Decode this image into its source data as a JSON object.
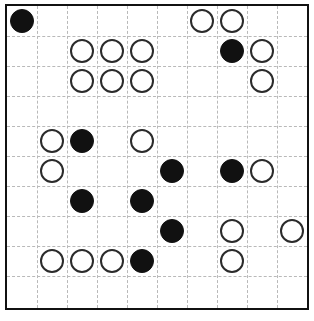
{
  "app": {
    "title": "Stone Grid Puzzle",
    "kind": "grid-board"
  },
  "board": {
    "name": "stone-board",
    "columns": 10,
    "rows": 10,
    "cell_size_px": 30,
    "origin_x_px": 6,
    "origin_y_px": 5,
    "grid_style": "dashed",
    "grid_color": "#b9b9b9",
    "border_color": "#111111",
    "background_color": "#ffffff",
    "stone_colors": {
      "black": "#111111",
      "white_fill": "#ffffff",
      "white_outline": "#2b2b2b"
    },
    "stone_diameter_px": 24,
    "legend": {
      "black_label": "black stone",
      "white_label": "white stone",
      "empty_label": "empty cell"
    },
    "counts": {
      "black": 12,
      "white": 18,
      "total": 30
    },
    "stones": [
      {
        "row": 0,
        "col": 0,
        "color": "black"
      },
      {
        "row": 0,
        "col": 6,
        "color": "white"
      },
      {
        "row": 0,
        "col": 7,
        "color": "white"
      },
      {
        "row": 1,
        "col": 2,
        "color": "white"
      },
      {
        "row": 1,
        "col": 3,
        "color": "white"
      },
      {
        "row": 1,
        "col": 4,
        "color": "white"
      },
      {
        "row": 1,
        "col": 7,
        "color": "black"
      },
      {
        "row": 1,
        "col": 8,
        "color": "white"
      },
      {
        "row": 2,
        "col": 2,
        "color": "white"
      },
      {
        "row": 2,
        "col": 3,
        "color": "white"
      },
      {
        "row": 2,
        "col": 4,
        "color": "white"
      },
      {
        "row": 2,
        "col": 8,
        "color": "white"
      },
      {
        "row": 4,
        "col": 1,
        "color": "white"
      },
      {
        "row": 4,
        "col": 2,
        "color": "black"
      },
      {
        "row": 4,
        "col": 4,
        "color": "white"
      },
      {
        "row": 5,
        "col": 1,
        "color": "white"
      },
      {
        "row": 5,
        "col": 5,
        "color": "black"
      },
      {
        "row": 5,
        "col": 7,
        "color": "black"
      },
      {
        "row": 5,
        "col": 8,
        "color": "white"
      },
      {
        "row": 6,
        "col": 2,
        "color": "black"
      },
      {
        "row": 6,
        "col": 4,
        "color": "black"
      },
      {
        "row": 7,
        "col": 5,
        "color": "black"
      },
      {
        "row": 7,
        "col": 7,
        "color": "white"
      },
      {
        "row": 7,
        "col": 9,
        "color": "white"
      },
      {
        "row": 8,
        "col": 1,
        "color": "white"
      },
      {
        "row": 8,
        "col": 2,
        "color": "white"
      },
      {
        "row": 8,
        "col": 3,
        "color": "white"
      },
      {
        "row": 8,
        "col": 4,
        "color": "black"
      },
      {
        "row": 8,
        "col": 7,
        "color": "white"
      }
    ]
  }
}
